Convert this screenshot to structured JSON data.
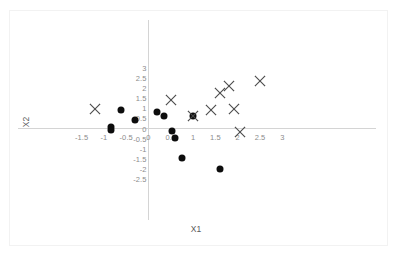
{
  "chart_data": {
    "type": "scatter",
    "title": "",
    "xlabel": "X1",
    "ylabel": "X2",
    "xlim": [
      -1.75,
      3.1
    ],
    "ylim": [
      -2.75,
      3.05
    ],
    "grid": false,
    "legend_position": "none",
    "x_ticks": [
      "-1.5",
      "-1",
      "-0.5",
      "0",
      "0.5",
      "1",
      "1.5",
      "2",
      "2.5",
      "3"
    ],
    "x_tick_values": [
      -1.5,
      -1,
      -0.5,
      0,
      0.5,
      1,
      1.5,
      2,
      2.5,
      3
    ],
    "y_ticks": [
      "3",
      "2.5",
      "2",
      "1.5",
      "1",
      "0.5",
      "0",
      "-0.5",
      "-1",
      "-1.5",
      "-2",
      "-2.5"
    ],
    "y_tick_values": [
      3,
      2.5,
      2,
      1.5,
      1,
      0.5,
      0,
      -0.5,
      -1,
      -1.5,
      -2,
      -2.5
    ],
    "series": [
      {
        "name": "circle-class",
        "marker": "circle",
        "color": "#0d0d0d",
        "points": [
          [
            -0.83,
            0.07
          ],
          [
            -0.84,
            -0.05
          ],
          [
            -0.62,
            0.93
          ],
          [
            -0.3,
            0.43
          ],
          [
            0.2,
            0.8
          ],
          [
            0.35,
            0.62
          ],
          [
            0.52,
            -0.1
          ],
          [
            0.6,
            -0.45
          ],
          [
            0.75,
            -1.47
          ],
          [
            1.0,
            0.6
          ],
          [
            1.6,
            -2.0
          ]
        ]
      },
      {
        "name": "cross-class",
        "marker": "x",
        "color": "#4a4a4a",
        "points": [
          [
            -1.2,
            0.97
          ],
          [
            0.5,
            1.42
          ],
          [
            1.0,
            0.6
          ],
          [
            1.4,
            0.9
          ],
          [
            1.6,
            1.78
          ],
          [
            1.8,
            2.1
          ],
          [
            1.92,
            0.95
          ],
          [
            2.05,
            -0.17
          ],
          [
            2.5,
            2.35
          ]
        ]
      }
    ]
  },
  "axis": {
    "x_title": "X1",
    "y_title": "X2"
  }
}
